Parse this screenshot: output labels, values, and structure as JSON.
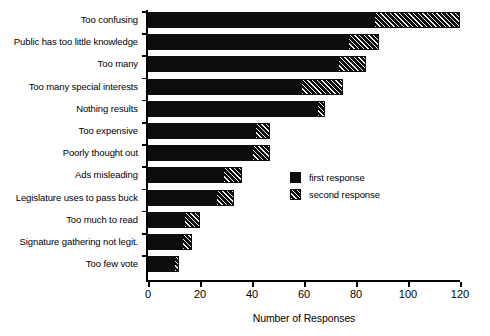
{
  "chart_data": {
    "type": "bar",
    "orientation": "horizontal",
    "stacked": true,
    "title": "",
    "xlabel": "Number of Responses",
    "ylabel": "",
    "xlim": [
      0,
      120
    ],
    "xticks": [
      0,
      20,
      40,
      60,
      80,
      100,
      120
    ],
    "xticklabels": [
      "0",
      "20",
      "40",
      "60",
      "80",
      "100",
      "120"
    ],
    "grid": false,
    "legend_position": "center-right",
    "categories": [
      "Too confusing",
      "Public has too little knowledge",
      "Too many",
      "Too many special interests",
      "Nothing results",
      "Too expensive",
      "Poorly thought out",
      "Ads misleading",
      "Legislature uses to pass buck",
      "Too much to read",
      "Signature gathering not legit.",
      "Too few vote"
    ],
    "series": [
      {
        "name": "first response",
        "color": "#0d0d0d",
        "pattern": "solid",
        "values": [
          87,
          77,
          73,
          59,
          65,
          41,
          40,
          29,
          26,
          14,
          13,
          10
        ]
      },
      {
        "name": "second response",
        "color": "#111111",
        "pattern": "diagonal-hatch",
        "values": [
          33,
          12,
          11,
          16,
          3,
          6,
          7,
          7,
          7,
          6,
          4,
          2
        ]
      }
    ],
    "totals": [
      120,
      89,
      84,
      75,
      68,
      47,
      47,
      36,
      33,
      20,
      17,
      12
    ]
  },
  "legend": {
    "entries": [
      {
        "label": "first response",
        "swatch": "solid-black"
      },
      {
        "label": "second response",
        "swatch": "hatched"
      }
    ]
  },
  "axis": {
    "x_title": "Number of Responses"
  }
}
